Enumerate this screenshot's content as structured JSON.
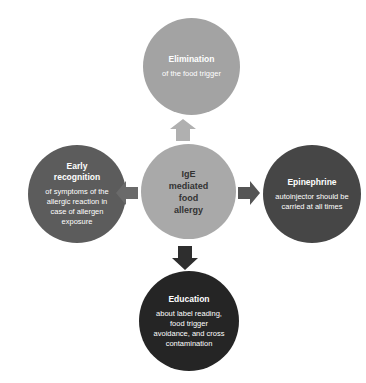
{
  "diagram": {
    "center": {
      "title": "IgE mediated food allergy",
      "color": "#a9a9a9"
    },
    "nodes": [
      {
        "id": "top",
        "title": "Elimination",
        "desc": "of the food trigger",
        "color": "#a3a3a3"
      },
      {
        "id": "left",
        "title": "Early recognition",
        "desc": "of symptoms of the allergic reaction in case of allergen exposure",
        "color": "#5c5c5c"
      },
      {
        "id": "right",
        "title": "Epinephrine",
        "desc": "autoinjector should be carried at all times",
        "color": "#464646"
      },
      {
        "id": "bottom",
        "title": "Education",
        "desc": "about label reading, food trigger avoidance, and cross contamination",
        "color": "#252525"
      }
    ],
    "arrows": {
      "up": {
        "color": "#b0b0b0"
      },
      "left": {
        "color": "#6a6a6a"
      },
      "right": {
        "color": "#555555"
      },
      "down": {
        "color": "#2e2e2e"
      }
    }
  }
}
